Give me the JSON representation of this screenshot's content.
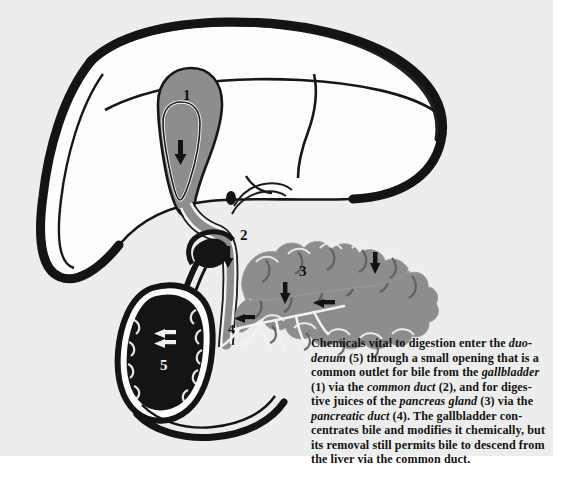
{
  "figure": {
    "background_color": "#eceded",
    "organ_fill_gray": "#8d8d8d",
    "organ_outline_black": "#141414",
    "liver_fill": "#fdfdfd",
    "duodenum_fill": "#141414",
    "labels": [
      {
        "id": "1",
        "text": "1",
        "organ": "gallbladder",
        "color": "#111111"
      },
      {
        "id": "2",
        "text": "2",
        "organ": "common duct",
        "color": "#111111"
      },
      {
        "id": "3",
        "text": "3",
        "organ": "pancreas gland",
        "color": "#111111"
      },
      {
        "id": "4",
        "text": "4",
        "organ": "pancreatic duct",
        "color": "#111111"
      },
      {
        "id": "5",
        "text": "5",
        "organ": "duodenum",
        "color": "#f2f2f2"
      }
    ]
  },
  "caption": {
    "lines": [
      [
        {
          "t": "Chemicals vital to digestion enter the ",
          "i": false
        },
        {
          "t": "duo-",
          "i": true
        }
      ],
      [
        {
          "t": "denum",
          "i": true
        },
        {
          "t": " (5) through a small opening that is a",
          "i": false
        }
      ],
      [
        {
          "t": "common outlet for bile from the ",
          "i": false
        },
        {
          "t": "gallbladder",
          "i": true
        }
      ],
      [
        {
          "t": "(1) via the ",
          "i": false
        },
        {
          "t": "common duct",
          "i": true
        },
        {
          "t": " (2), and for diges-",
          "i": false
        }
      ],
      [
        {
          "t": "tive juices of the ",
          "i": false
        },
        {
          "t": "pancreas gland",
          "i": true
        },
        {
          "t": " (3) via the",
          "i": false
        }
      ],
      [
        {
          "t": "pancreatic duct",
          "i": true
        },
        {
          "t": " (4). The gallbladder con-",
          "i": false
        }
      ],
      [
        {
          "t": "centrates bile and modifies it chemically, but",
          "i": false
        }
      ],
      [
        {
          "t": "its removal still permits bile to descend from",
          "i": false
        }
      ],
      [
        {
          "t": "the liver via the common duct.",
          "i": false
        }
      ]
    ]
  }
}
